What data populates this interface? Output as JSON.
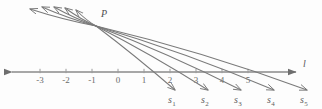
{
  "figure": {
    "background_color": "#fdfdfd",
    "line_color": "#7a7a7a",
    "axis_color": "#8a8a8a",
    "text_color": "#5b5b5b"
  },
  "axis": {
    "name": "l",
    "label": "l",
    "y": 72,
    "x_start": 12,
    "x_end": 296,
    "left_arrow": true,
    "right_arrow": true,
    "label_x": 303,
    "label_y": 67,
    "ticks": [
      {
        "label": "-3",
        "x": 40
      },
      {
        "label": "-2",
        "x": 66
      },
      {
        "label": "-1",
        "x": 92
      },
      {
        "label": "0",
        "x": 118
      },
      {
        "label": "1",
        "x": 144
      },
      {
        "label": "2",
        "x": 170
      },
      {
        "label": "3",
        "x": 196
      },
      {
        "label": "4",
        "x": 222
      },
      {
        "label": "5",
        "x": 248
      }
    ],
    "tick_label_y": 83
  },
  "point_p": {
    "label": "P",
    "x": 96,
    "y": 26,
    "label_x": 101,
    "label_y": 17
  },
  "rays_down_right": [
    {
      "name": "s1",
      "label": "s",
      "sub": "1",
      "end_x": 175,
      "end_y": 90,
      "label_x": 168,
      "label_y": 103
    },
    {
      "name": "s2",
      "label": "s",
      "sub": "2",
      "end_x": 208,
      "end_y": 90,
      "label_x": 201,
      "label_y": 103
    },
    {
      "name": "s3",
      "label": "s",
      "sub": "3",
      "end_x": 241,
      "end_y": 90,
      "label_x": 234,
      "label_y": 103
    },
    {
      "name": "s4",
      "label": "s",
      "sub": "4",
      "end_x": 274,
      "end_y": 90,
      "label_x": 267,
      "label_y": 103
    },
    {
      "name": "s5",
      "label": "s",
      "sub": "5",
      "end_x": 307,
      "end_y": 90,
      "label_x": 300,
      "label_y": 103
    }
  ],
  "rays_up_left": [
    {
      "name": "ray-up-1",
      "end_x": 30,
      "end_y": 9
    },
    {
      "name": "ray-up-2",
      "end_x": 42,
      "end_y": 7
    },
    {
      "name": "ray-up-3",
      "end_x": 54,
      "end_y": 7
    },
    {
      "name": "ray-up-4",
      "end_x": 65,
      "end_y": 8
    },
    {
      "name": "ray-up-5",
      "end_x": 76,
      "end_y": 10
    }
  ],
  "ray_control_offsets": {
    "bow_y": 6,
    "description": "slight upward bow on the down-right rays"
  }
}
